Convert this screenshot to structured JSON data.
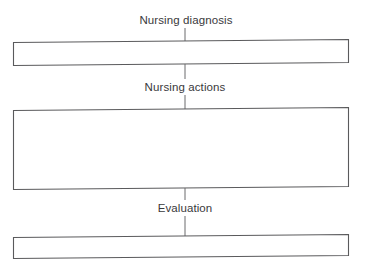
{
  "diagram": {
    "type": "flowchart",
    "orientation": "vertical",
    "title": "",
    "background_color": "#ffffff",
    "stroke_color": "#5a5a5c",
    "text_color": "#39393b",
    "labels": [
      {
        "id": "nursing-diagnosis",
        "text": "Nursing diagnosis"
      },
      {
        "id": "nursing-actions",
        "text": "Nursing actions"
      },
      {
        "id": "evaluation",
        "text": "Evaluation"
      }
    ],
    "boxes": [
      {
        "id": "box-nursing-diagnosis",
        "text": "",
        "height": "short"
      },
      {
        "id": "box-nursing-actions",
        "text": "",
        "height": "tall"
      },
      {
        "id": "box-evaluation",
        "text": "",
        "height": "short"
      }
    ],
    "connectors": [
      {
        "id": "connector-top-to-diagnosis-box"
      },
      {
        "id": "connector-diagnosis-box-to-actions-label"
      },
      {
        "id": "connector-actions-label-to-actions-box"
      },
      {
        "id": "connector-actions-box-to-evaluation-label"
      },
      {
        "id": "connector-evaluation-label-to-evaluation-box"
      }
    ]
  }
}
